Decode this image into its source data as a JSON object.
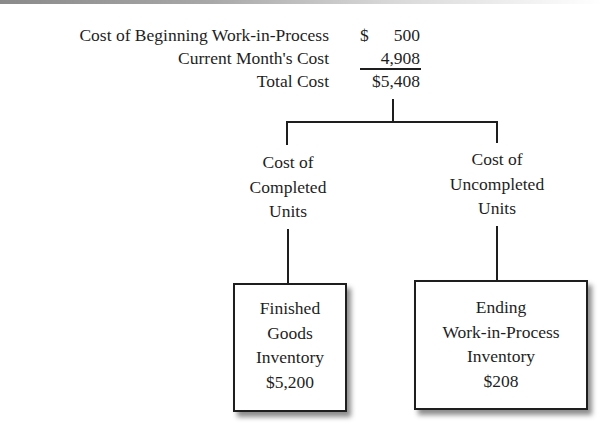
{
  "decoration": {
    "top_bar": "gray-gradient"
  },
  "cost_summary": {
    "rows": [
      {
        "label": "Cost of Beginning Work-in-Process",
        "currency": "$",
        "amount": "500"
      },
      {
        "label": "Current Month's Cost",
        "currency": "",
        "amount": "4,908"
      },
      {
        "label": "Total Cost",
        "currency": "",
        "amount": "$5,408"
      }
    ]
  },
  "branches": {
    "left": {
      "label_lines": [
        "Cost of",
        "Completed",
        "Units"
      ],
      "box": {
        "lines": [
          "Finished",
          "Goods",
          "Inventory",
          "$5,200"
        ]
      }
    },
    "right": {
      "label_lines": [
        "Cost of",
        "Uncompleted",
        "Units"
      ],
      "box": {
        "lines": [
          "Ending",
          "Work-in-Process",
          "Inventory",
          "$208"
        ]
      }
    }
  },
  "colors": {
    "line": "#1e1e1e",
    "text": "#1e1e1e",
    "background": "#ffffff"
  }
}
